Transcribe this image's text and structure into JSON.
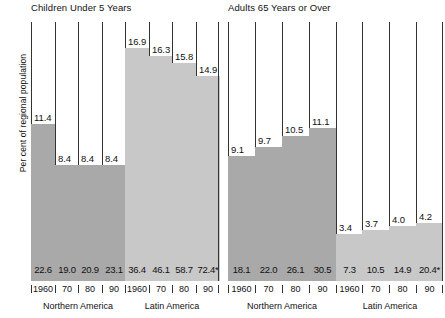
{
  "axis": {
    "ylabel": "Per cent of regional population"
  },
  "colors": {
    "northern_america": "#a9a9a9",
    "latin_america": "#c8c8c8",
    "outline": "#3a3a3a",
    "text": "#111111",
    "background": "#ffffff"
  },
  "panels": [
    {
      "title": "Children Under 5 Years",
      "groups": [
        {
          "name": "Northern America",
          "color_key": "northern_america",
          "bars": [
            {
              "year": "1960",
              "percent": 11.4,
              "percent_label": "11.4",
              "value_label": "22.6"
            },
            {
              "year": "70",
              "percent": 8.4,
              "percent_label": "8.4",
              "value_label": "19.0"
            },
            {
              "year": "80",
              "percent": 8.4,
              "percent_label": "8.4",
              "value_label": "20.9"
            },
            {
              "year": "90",
              "percent": 8.4,
              "percent_label": "8.4",
              "value_label": "23.1"
            }
          ]
        },
        {
          "name": "Latin America",
          "color_key": "latin_america",
          "bars": [
            {
              "year": "1960",
              "percent": 16.9,
              "percent_label": "16.9",
              "value_label": "36.4"
            },
            {
              "year": "70",
              "percent": 16.3,
              "percent_label": "16.3",
              "value_label": "46.1"
            },
            {
              "year": "80",
              "percent": 15.8,
              "percent_label": "15.8",
              "value_label": "58.7"
            },
            {
              "year": "90",
              "percent": 14.9,
              "percent_label": "14.9",
              "value_label": "72.4*"
            }
          ]
        }
      ]
    },
    {
      "title": "Adults 65 Years or Over",
      "groups": [
        {
          "name": "Northern America",
          "color_key": "northern_america",
          "bars": [
            {
              "year": "1960",
              "percent": 9.1,
              "percent_label": "9.1",
              "value_label": "18.1"
            },
            {
              "year": "70",
              "percent": 9.7,
              "percent_label": "9.7",
              "value_label": "22.0"
            },
            {
              "year": "80",
              "percent": 10.5,
              "percent_label": "10.5",
              "value_label": "26.1"
            },
            {
              "year": "90",
              "percent": 11.1,
              "percent_label": "11.1",
              "value_label": "30.5"
            }
          ]
        },
        {
          "name": "Latin America",
          "color_key": "latin_america",
          "bars": [
            {
              "year": "1960",
              "percent": 3.4,
              "percent_label": "3.4",
              "value_label": "7.3"
            },
            {
              "year": "70",
              "percent": 3.7,
              "percent_label": "3.7",
              "value_label": "10.5"
            },
            {
              "year": "80",
              "percent": 4.0,
              "percent_label": "4.0",
              "value_label": "14.9"
            },
            {
              "year": "90",
              "percent": 4.2,
              "percent_label": "4.2",
              "value_label": "20.4*"
            }
          ]
        }
      ]
    }
  ],
  "chart_data": {
    "type": "bar",
    "title": "",
    "xlabel": "",
    "ylabel": "Per cent of regional population",
    "ylim": [
      0,
      18.8
    ],
    "grid": false,
    "legend": "none",
    "categories": [
      "1960",
      "70",
      "80",
      "90"
    ],
    "panels": [
      {
        "title": "Children Under 5 Years",
        "series": [
          {
            "name": "Northern America",
            "categories": [
              "1960",
              "70",
              "80",
              "90"
            ],
            "values": [
              11.4,
              8.4,
              8.4,
              8.4
            ],
            "inbar_values": [
              22.6,
              19.0,
              20.9,
              23.1
            ],
            "color": "#a9a9a9"
          },
          {
            "name": "Latin America",
            "categories": [
              "1960",
              "70",
              "80",
              "90"
            ],
            "values": [
              16.9,
              16.3,
              15.8,
              14.9
            ],
            "inbar_values": [
              36.4,
              46.1,
              58.7,
              72.4
            ],
            "inbar_labels": [
              "36.4",
              "46.1",
              "58.7",
              "72.4*"
            ],
            "color": "#c8c8c8"
          }
        ]
      },
      {
        "title": "Adults 65 Years or Over",
        "series": [
          {
            "name": "Northern America",
            "categories": [
              "1960",
              "70",
              "80",
              "90"
            ],
            "values": [
              9.1,
              9.7,
              10.5,
              11.1
            ],
            "inbar_values": [
              18.1,
              22.0,
              26.1,
              30.5
            ],
            "color": "#a9a9a9"
          },
          {
            "name": "Latin America",
            "categories": [
              "1960",
              "70",
              "80",
              "90"
            ],
            "values": [
              3.4,
              3.7,
              4.0,
              4.2
            ],
            "inbar_values": [
              7.3,
              10.5,
              14.9,
              20.4
            ],
            "inbar_labels": [
              "7.3",
              "10.5",
              "14.9",
              "20.4*"
            ],
            "color": "#c8c8c8"
          }
        ]
      }
    ]
  }
}
